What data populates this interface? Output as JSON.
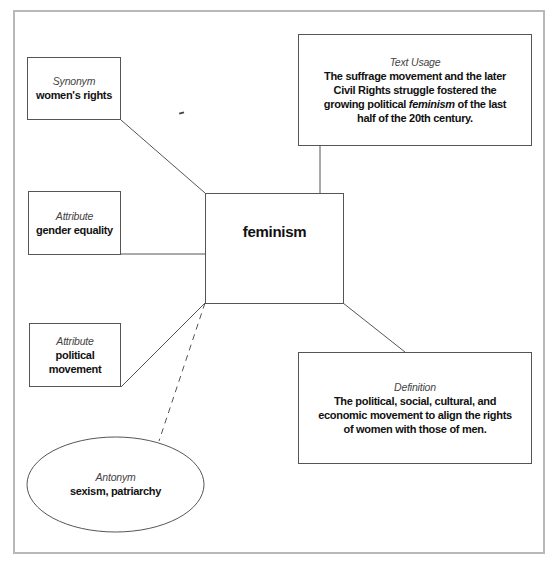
{
  "diagram": {
    "type": "word-map",
    "center": {
      "word": "feminism"
    },
    "synonym": {
      "label": "Synonym",
      "value": "women's rights"
    },
    "attributes": [
      {
        "label": "Attribute",
        "value": "gender equality"
      },
      {
        "label": "Attribute",
        "value": "political movement"
      }
    ],
    "antonym": {
      "label": "Antonym",
      "value": "sexism, patriarchy"
    },
    "text_usage": {
      "label": "Text Usage",
      "value_before": "The suffrage movement and the later Civil Rights struggle fostered the growing political ",
      "value_emphasis": "feminism",
      "value_after": " of the last half of the 20th century."
    },
    "definition": {
      "label": "Definition",
      "value": "The political, social, cultural, and economic movement to align the rights of women with those of men."
    },
    "colors": {
      "box_border": "#555555",
      "frame_border": "#b8b8b8",
      "background": "#ffffff"
    }
  }
}
